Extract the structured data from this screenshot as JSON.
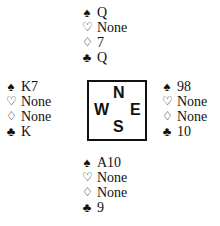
{
  "suits": {
    "spades": "♠",
    "hearts": "♡",
    "diamonds": "♢",
    "clubs": "♣"
  },
  "hands": {
    "north": {
      "spades": "Q",
      "hearts": "None",
      "diamonds": "7",
      "clubs": "Q"
    },
    "west": {
      "spades": "K7",
      "hearts": "None",
      "diamonds": "None",
      "clubs": "K"
    },
    "east": {
      "spades": "98",
      "hearts": "None",
      "diamonds": "None",
      "clubs": "10"
    },
    "south": {
      "spades": "A10",
      "hearts": "None",
      "diamonds": "None",
      "clubs": "9"
    }
  },
  "compass": {
    "n": "N",
    "w": "W",
    "e": "E",
    "s": "S"
  }
}
